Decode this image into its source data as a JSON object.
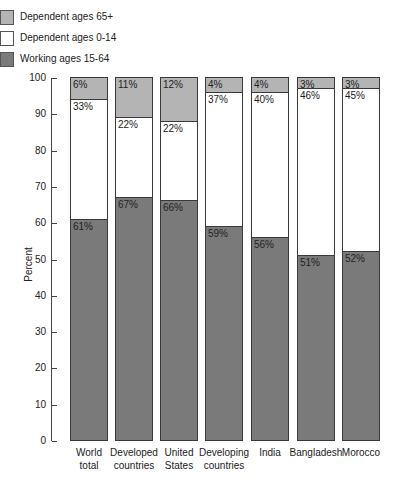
{
  "chart_data": {
    "type": "bar",
    "stacked": true,
    "title": "",
    "xlabel": "",
    "ylabel": "Percent",
    "ylim": [
      0,
      100
    ],
    "yticks": [
      0,
      10,
      20,
      30,
      40,
      50,
      60,
      70,
      80,
      90,
      100
    ],
    "grid": false,
    "legend_position": "top-left",
    "categories": [
      "World total",
      "Developed countries",
      "United States",
      "Developing countries",
      "India",
      "Bangladesh",
      "Morocco"
    ],
    "category_lines": [
      [
        "World",
        "total"
      ],
      [
        "Developed",
        "countries"
      ],
      [
        "United",
        "States"
      ],
      [
        "Developing",
        "countries"
      ],
      [
        "India"
      ],
      [
        "Bangladesh"
      ],
      [
        "Morocco"
      ]
    ],
    "series": [
      {
        "name": "Working ages 15-64",
        "color": "#7a7a7a",
        "values": [
          61,
          67,
          66,
          59,
          56,
          51,
          52
        ]
      },
      {
        "name": "Dependent ages 0-14",
        "color": "#ffffff",
        "values": [
          33,
          22,
          22,
          37,
          40,
          46,
          45
        ]
      },
      {
        "name": "Dependent ages 65+",
        "color": "#b4b4b4",
        "values": [
          6,
          11,
          12,
          4,
          4,
          3,
          3
        ]
      }
    ],
    "legend_order": [
      "Dependent ages 65+",
      "Dependent ages 0-14",
      "Working ages 15-64"
    ]
  },
  "legend": {
    "items": [
      {
        "label": "Dependent ages 65+",
        "color": "#b4b4b4"
      },
      {
        "label": "Dependent ages 0-14",
        "color": "#ffffff"
      },
      {
        "label": "Working ages 15-64",
        "color": "#7a7a7a"
      }
    ]
  },
  "axis": {
    "ylabel": "Percent",
    "ticks": [
      "0",
      "10",
      "20",
      "30",
      "40",
      "50",
      "60",
      "70",
      "80",
      "90",
      "100"
    ]
  }
}
